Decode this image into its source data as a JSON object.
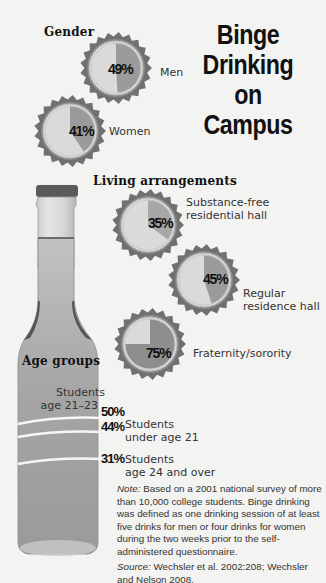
{
  "title": [
    "Binge",
    "Drinking",
    "on Campus"
  ],
  "sections": {
    "gender": "Gender",
    "living": "Living arrangements",
    "age": "Age groups"
  },
  "gender": [
    {
      "label": "Men",
      "pct": "49%",
      "value": 49
    },
    {
      "label": "Women",
      "pct": "41%",
      "value": 41
    }
  ],
  "living": [
    {
      "label_lines": [
        "Substance-free",
        "residential hall"
      ],
      "pct": "35%",
      "value": 35
    },
    {
      "label_lines": [
        "Regular",
        "residence hall"
      ],
      "pct": "45%",
      "value": 45
    },
    {
      "label_lines": [
        "Fraternity/sorority"
      ],
      "pct": "75%",
      "value": 75
    }
  ],
  "age": [
    {
      "label_lines": [
        "Students",
        "age 21–23"
      ],
      "pct": "50%",
      "value": 50
    },
    {
      "label_lines": [
        "Students",
        "under age 21"
      ],
      "pct": "44%",
      "value": 44
    },
    {
      "label_lines": [
        "Students",
        "age 24 and over"
      ],
      "pct": "31%",
      "value": 31
    }
  ],
  "note": {
    "note_label": "Note:",
    "note_text": " Based on a 2001 national survey of more than 10,000 college students. Binge drinking was defined as one drinking session of at least five drinks for men or four drinks for women during the two weeks prior to the self-administered questionnaire.",
    "source_label": "Source:",
    "source_text": " Wechsler et al. 2002:208; Wechsler and Nelson 2008."
  },
  "colors": {
    "background": "#f3f3f1",
    "cap_rim": "#6e6e6e",
    "cap_face": "#d9d9d9",
    "slice": "#9a9a9a",
    "bottle_liquid": "#a9a9a9",
    "bottle_glass": "#dcdcdc"
  },
  "chart_data": {
    "type": "pie",
    "title": "Binge Drinking on Campus",
    "groups": [
      {
        "name": "Gender",
        "categories": [
          "Men",
          "Women"
        ],
        "values": [
          49,
          41
        ]
      },
      {
        "name": "Living arrangements",
        "categories": [
          "Substance-free residential hall",
          "Regular residence hall",
          "Fraternity/sorority"
        ],
        "values": [
          35,
          45,
          75
        ]
      },
      {
        "name": "Age groups",
        "categories": [
          "Students age 21–23",
          "Students under age 21",
          "Students age 24 and over"
        ],
        "values": [
          50,
          44,
          31
        ],
        "render": "bottle fill levels"
      }
    ],
    "unit": "% of students who binge drink",
    "annotations": [
      "Note: Based on a 2001 national survey of more than 10,000 college students.",
      "Source: Wechsler et al. 2002:208; Wechsler and Nelson 2008."
    ]
  }
}
